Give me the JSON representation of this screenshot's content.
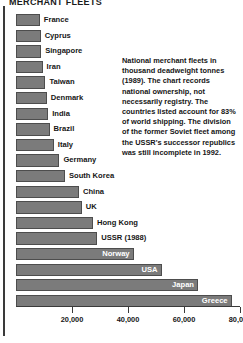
{
  "title": "MERCHANT FLEETS",
  "caption": "National merchant fleets in thousand deadweight tonnes (1989). The chart records national ownership, not necessarily registry. The countries listed account for 83% of world shipping. The division of the former Soviet fleet among the USSR's successor republics was still incomplete in 1992.",
  "colors": {
    "bar_fill": "#7b7b7b",
    "bar_stroke": "#4d4d4d",
    "text": "#161616",
    "axis": "#3a3a3a",
    "background": "#ffffff"
  },
  "chart_data": {
    "type": "bar",
    "orientation": "horizontal",
    "title": "MERCHANT FLEETS",
    "xlabel": "",
    "ylabel": "",
    "xlim": [
      0,
      80000
    ],
    "grid": false,
    "legend": null,
    "unit": "thousand deadweight tonnes",
    "year": 1989,
    "tick_labels": [
      "20,000",
      "40,000",
      "60,000",
      "80,000"
    ],
    "tick_values": [
      20000,
      40000,
      60000,
      80000
    ],
    "categories": [
      "France",
      "Cyprus",
      "Singapore",
      "Iran",
      "Taiwan",
      "Denmark",
      "India",
      "Brazil",
      "Italy",
      "Germany",
      "South Korea",
      "China",
      "UK",
      "Hong Kong",
      "USSR (1988)",
      "Norway",
      "USA",
      "Japan",
      "Greece"
    ],
    "values": [
      8500,
      8800,
      9000,
      9500,
      10500,
      11000,
      11500,
      12000,
      13500,
      15500,
      17500,
      22500,
      23500,
      27500,
      29000,
      42000,
      52000,
      65000,
      77000
    ],
    "bars": [
      {
        "label": "France",
        "value": 8500,
        "label_position": "outside"
      },
      {
        "label": "Cyprus",
        "value": 8800,
        "label_position": "outside"
      },
      {
        "label": "Singapore",
        "value": 9000,
        "label_position": "outside"
      },
      {
        "label": "Iran",
        "value": 9500,
        "label_position": "outside"
      },
      {
        "label": "Taiwan",
        "value": 10500,
        "label_position": "outside"
      },
      {
        "label": "Denmark",
        "value": 11000,
        "label_position": "outside"
      },
      {
        "label": "India",
        "value": 11500,
        "label_position": "outside"
      },
      {
        "label": "Brazil",
        "value": 12000,
        "label_position": "outside"
      },
      {
        "label": "Italy",
        "value": 13500,
        "label_position": "outside"
      },
      {
        "label": "Germany",
        "value": 15500,
        "label_position": "outside"
      },
      {
        "label": "South Korea",
        "value": 17500,
        "label_position": "outside"
      },
      {
        "label": "China",
        "value": 22500,
        "label_position": "outside"
      },
      {
        "label": "UK",
        "value": 23500,
        "label_position": "outside"
      },
      {
        "label": "Hong Kong",
        "value": 27500,
        "label_position": "outside"
      },
      {
        "label": "USSR (1988)",
        "value": 29000,
        "label_position": "outside"
      },
      {
        "label": "Norway",
        "value": 42000,
        "label_position": "inside"
      },
      {
        "label": "USA",
        "value": 52000,
        "label_position": "inside"
      },
      {
        "label": "Japan",
        "value": 65000,
        "label_position": "inside"
      },
      {
        "label": "Greece",
        "value": 77000,
        "label_position": "inside"
      }
    ]
  }
}
